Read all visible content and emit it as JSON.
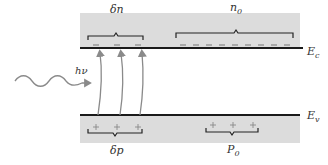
{
  "diagram": {
    "title": "",
    "conduction_band": {
      "edge_label": "E",
      "edge_sub": "c",
      "excess_label": "δn",
      "equilibrium_label": "n",
      "equilibrium_sub": "0",
      "excess_electrons": 3,
      "equilibrium_electrons": 10,
      "carrier_symbol": "−"
    },
    "valence_band": {
      "edge_label": "E",
      "edge_sub": "v",
      "excess_label": "δp",
      "equilibrium_label": "P",
      "equilibrium_sub": "0",
      "excess_holes": 3,
      "equilibrium_holes": 3,
      "carrier_symbol": "+"
    },
    "photon": {
      "label": "hν"
    },
    "colors": {
      "band_fill": "#d9d9d9",
      "line": "#1a1a1a",
      "arrow": "#8a8a8a",
      "text": "#333333"
    }
  }
}
